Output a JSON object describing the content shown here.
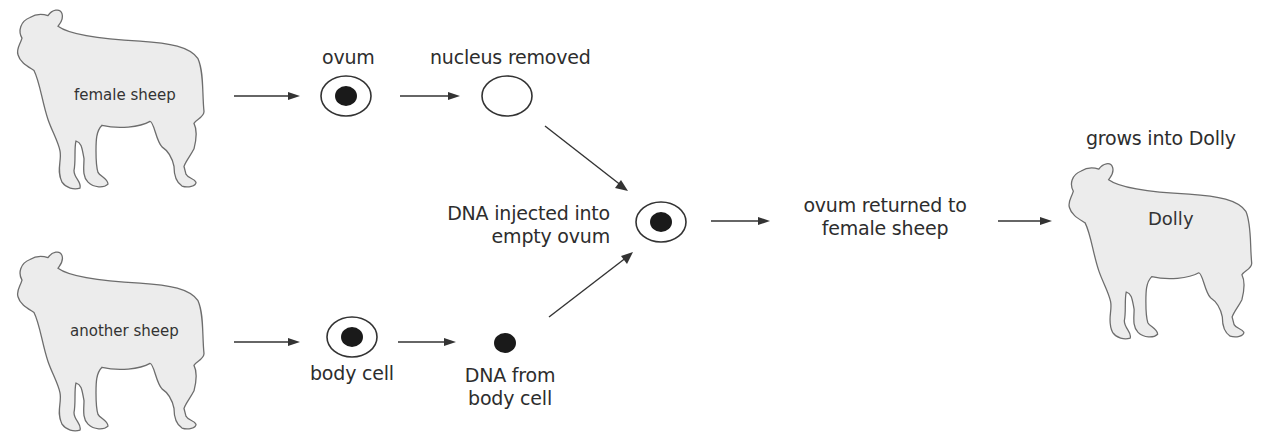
{
  "diagram": {
    "nodes": {
      "female_sheep": {
        "label": "female sheep"
      },
      "another_sheep": {
        "label": "another sheep"
      },
      "ovum": {
        "label": "ovum"
      },
      "nucleus_removed": {
        "label": "nucleus removed"
      },
      "body_cell": {
        "label": "body cell"
      },
      "dna_from_body_cell": {
        "label_line1": "DNA from",
        "label_line2": "body cell"
      },
      "dna_injected": {
        "label_line1": "DNA injected into",
        "label_line2": "empty ovum"
      },
      "ovum_returned": {
        "label_line1": "ovum returned to",
        "label_line2": "female sheep"
      },
      "dolly": {
        "label": "Dolly",
        "caption": "grows into Dolly"
      }
    },
    "edges": [
      {
        "from": "female_sheep",
        "to": "ovum"
      },
      {
        "from": "ovum",
        "to": "nucleus_removed"
      },
      {
        "from": "nucleus_removed",
        "to": "dna_injected"
      },
      {
        "from": "another_sheep",
        "to": "body_cell"
      },
      {
        "from": "body_cell",
        "to": "dna_from_body_cell"
      },
      {
        "from": "dna_from_body_cell",
        "to": "dna_injected"
      },
      {
        "from": "dna_injected",
        "to": "ovum_returned"
      },
      {
        "from": "ovum_returned",
        "to": "dolly"
      }
    ],
    "colors": {
      "sheep_fill": "#ececec",
      "sheep_outline": "#6d6d6d",
      "nucleus": "#1a1a1a",
      "line": "#333333"
    }
  }
}
